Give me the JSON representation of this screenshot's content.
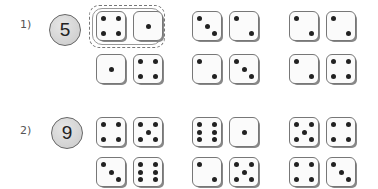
{
  "problems": [
    {
      "label": "1)",
      "target": "5",
      "pairs": [
        {
          "dice": [
            4,
            1
          ],
          "circled": true
        },
        {
          "dice": [
            3,
            2
          ],
          "circled": false
        },
        {
          "dice": [
            2,
            2
          ],
          "circled": false
        },
        {
          "dice": [
            1,
            4
          ],
          "circled": false
        },
        {
          "dice": [
            2,
            3
          ],
          "circled": false
        },
        {
          "dice": [
            2,
            4
          ],
          "circled": false
        }
      ]
    },
    {
      "label": "2)",
      "target": "9",
      "pairs": [
        {
          "dice": [
            4,
            5
          ],
          "circled": false
        },
        {
          "dice": [
            6,
            1
          ],
          "circled": false
        },
        {
          "dice": [
            5,
            4
          ],
          "circled": false
        },
        {
          "dice": [
            3,
            6
          ],
          "circled": false
        },
        {
          "dice": [
            2,
            5
          ],
          "circled": false
        },
        {
          "dice": [
            4,
            3
          ],
          "circled": false
        }
      ]
    }
  ],
  "colors": {
    "pip": "#222222",
    "die_border": "#777777",
    "target_fill": "#d4d4d4"
  }
}
